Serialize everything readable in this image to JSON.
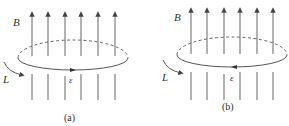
{
  "panels": [
    {
      "id": "a",
      "caption": "(a)",
      "field_label": "B",
      "loop_label": "L",
      "emf_label": "ε",
      "loop_arrow_direction": "left"
    },
    {
      "id": "b",
      "caption": "(b)",
      "field_label": "B",
      "loop_label": "L",
      "emf_label": "ε",
      "loop_arrow_direction": "right"
    }
  ],
  "colors": {
    "line": "#555555",
    "text": "#333333",
    "background": "#ffffff"
  }
}
